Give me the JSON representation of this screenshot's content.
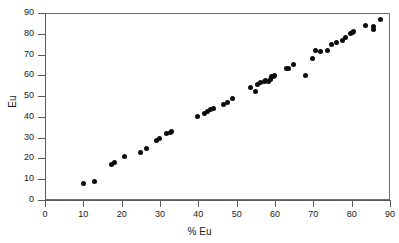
{
  "chart_data": {
    "type": "scatter",
    "title": "",
    "xlabel": "% Eu",
    "ylabel": "Eu",
    "xlim": [
      0,
      90
    ],
    "ylim": [
      0,
      90
    ],
    "xticks": [
      0,
      10,
      20,
      30,
      40,
      50,
      60,
      70,
      80,
      90
    ],
    "yticks": [
      0,
      10,
      20,
      30,
      40,
      50,
      60,
      70,
      80,
      90
    ],
    "xtick_labels": [
      "0",
      "10",
      "20",
      "30",
      "40",
      "50",
      "60",
      "70",
      "80",
      "90"
    ],
    "ytick_labels": [
      "0",
      "10",
      "20",
      "30",
      "40",
      "50",
      "60",
      "70",
      "80",
      "90"
    ],
    "grid": false,
    "legend": null,
    "marker": {
      "shape": "circle",
      "color": "#0d0d0d",
      "size": 5
    },
    "series": [
      {
        "name": "Eu measurements",
        "x": [
          10.0,
          13.0,
          17.3,
          18.0,
          20.7,
          24.8,
          26.6,
          29.2,
          29.9,
          31.8,
          32.7,
          33.0,
          39.8,
          41.6,
          42.4,
          43.3,
          43.9,
          46.6,
          47.6,
          49.0,
          53.7,
          54.8,
          55.4,
          56.3,
          57.2,
          57.6,
          58.2,
          58.7,
          59.2,
          59.6,
          59.8,
          62.9,
          63.5,
          64.8,
          67.9,
          69.8,
          70.6,
          71.9,
          73.6,
          74.7,
          76.1,
          77.5,
          78.4,
          79.8,
          80.3,
          80.6,
          83.6,
          85.6,
          85.7,
          87.6
        ],
        "y": [
          7.9,
          8.7,
          17.0,
          17.9,
          21.1,
          22.8,
          25.0,
          28.8,
          29.6,
          32.0,
          32.7,
          33.1,
          40.0,
          41.7,
          42.7,
          43.6,
          44.1,
          46.2,
          47.1,
          49.0,
          54.2,
          52.1,
          55.6,
          56.5,
          56.9,
          57.3,
          57.1,
          57.9,
          59.4,
          59.6,
          59.8,
          63.3,
          63.5,
          65.1,
          60.1,
          68.1,
          71.9,
          71.6,
          72.0,
          74.6,
          75.6,
          77.0,
          78.3,
          79.9,
          80.6,
          81.0,
          83.8,
          82.2,
          83.4,
          87.0
        ]
      }
    ]
  }
}
